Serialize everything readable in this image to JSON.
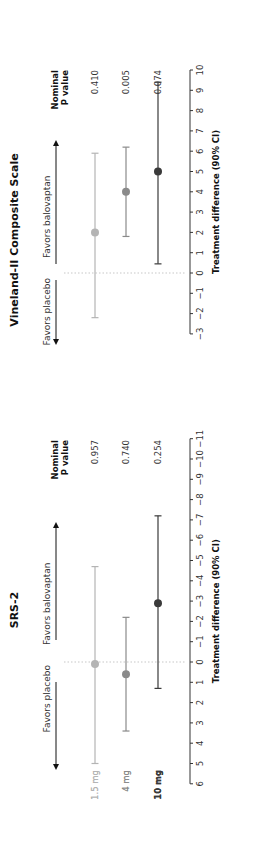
{
  "chart_data": [
    {
      "type": "forest",
      "title": "SRS-2",
      "xlabel": "Treatment difference (90% CI)",
      "direction_labels": {
        "left": "Favors placebo",
        "right": "Favors balovaptan"
      },
      "pvalue_header": [
        "Nominal",
        "P value"
      ],
      "axis": {
        "min": 6,
        "max": -11,
        "reversed": true,
        "ticks": [
          6,
          5,
          4,
          3,
          2,
          1,
          0,
          -1,
          -2,
          -3,
          -4,
          -5,
          -6,
          -7,
          -8,
          -9,
          -10,
          -11
        ]
      },
      "reference_line": 0,
      "series": [
        {
          "name": "1.5 mg",
          "estimate": 0.1,
          "ci_low": 5.0,
          "ci_high": -4.7,
          "p_value": "0.957",
          "color": "#b4b4b4"
        },
        {
          "name": "4 mg",
          "estimate": 0.6,
          "ci_low": 3.4,
          "ci_high": -2.2,
          "p_value": "0.740",
          "color": "#8a8a8a"
        },
        {
          "name": "10 mg",
          "estimate": -2.9,
          "ci_low": 1.3,
          "ci_high": -7.2,
          "p_value": "0.254",
          "color": "#3a3a3a"
        }
      ]
    },
    {
      "type": "forest",
      "title": "Vineland-II Composite Scale",
      "xlabel": "Treatment difference (90% CI)",
      "direction_labels": {
        "left": "Favors placebo",
        "right": "Favors balovaptan"
      },
      "pvalue_header": [
        "Nominal",
        "P value"
      ],
      "axis": {
        "min": -3,
        "max": 10,
        "reversed": false,
        "ticks": [
          -3,
          -2,
          -1,
          0,
          1,
          2,
          3,
          4,
          5,
          6,
          7,
          8,
          9,
          10
        ]
      },
      "reference_line": 0,
      "series": [
        {
          "name": "1.5 mg",
          "estimate": 2.0,
          "ci_low": -2.2,
          "ci_high": 5.9,
          "p_value": "0.410",
          "color": "#b4b4b4"
        },
        {
          "name": "4 mg",
          "estimate": 4.0,
          "ci_low": 1.8,
          "ci_high": 6.2,
          "p_value": "0.005",
          "color": "#8a8a8a"
        },
        {
          "name": "10 mg",
          "estimate": 5.0,
          "ci_low": 0.45,
          "ci_high": 9.4,
          "p_value": "0.074",
          "color": "#3a3a3a"
        }
      ]
    }
  ]
}
